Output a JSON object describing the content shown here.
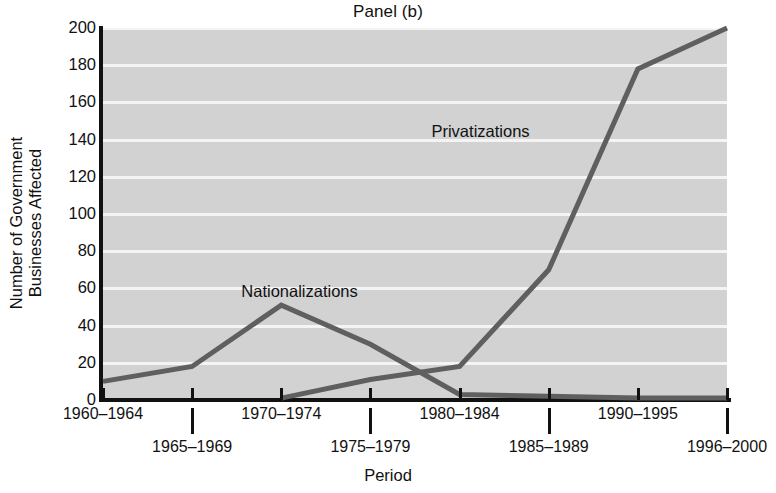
{
  "chart_data": {
    "type": "line",
    "title": "Panel (b)",
    "xlabel": "Period",
    "ylabel": "Number of Government\nBusinesses Affected",
    "categories": [
      "1960–1964",
      "1965–1969",
      "1970–1974",
      "1975–1979",
      "1980–1984",
      "1985–1989",
      "1990–1995",
      "1996–2000"
    ],
    "ylim": [
      0,
      200
    ],
    "yticks": [
      0,
      20,
      40,
      60,
      80,
      100,
      120,
      140,
      160,
      180,
      200
    ],
    "grid": "horizontal-white",
    "legend": "inline-annotations",
    "series": [
      {
        "name": "Nationalizations",
        "color": "#5f5f5f",
        "values": [
          10,
          18,
          51,
          30,
          3,
          2,
          1,
          1
        ],
        "label_x_frac": 0.315,
        "label_y_value": 58
      },
      {
        "name": "Privatizations",
        "color": "#5f5f5f",
        "values": [
          null,
          null,
          1,
          11,
          18,
          70,
          178,
          200
        ],
        "label_x_frac": 0.605,
        "label_y_value": 144
      }
    ]
  },
  "axis": {
    "tick_label_rows": [
      0,
      1,
      0,
      1,
      0,
      1,
      0,
      1
    ],
    "y_tick_labels": [
      "200",
      "180",
      "160",
      "140",
      "120",
      "100",
      "80",
      "60",
      "40",
      "20",
      "0"
    ]
  },
  "colors": {
    "plot_background": "#d2d2d2",
    "gridline": "#f4f4f4",
    "line": "#5f5f5f",
    "axis": "#111111",
    "page_background": "#ffffff"
  }
}
